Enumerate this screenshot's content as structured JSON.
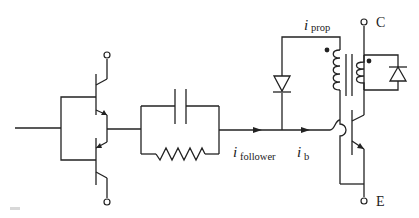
{
  "diagram": {
    "type": "circuit-schematic",
    "labels": {
      "i_follower": {
        "symbol": "i",
        "subscript": "follower"
      },
      "i_b": {
        "symbol": "i",
        "subscript": "b"
      },
      "i_prop": {
        "symbol": "i",
        "subscript": "prop"
      },
      "collector": "C",
      "emitter": "E"
    },
    "components": [
      {
        "id": "Q1",
        "kind": "npn-transistor",
        "role": "upper follower"
      },
      {
        "id": "Q2",
        "kind": "pnp-transistor",
        "role": "lower follower"
      },
      {
        "id": "C1",
        "kind": "capacitor",
        "role": "speed-up capacitor"
      },
      {
        "id": "R1",
        "kind": "resistor",
        "role": "base resistor"
      },
      {
        "id": "D1",
        "kind": "diode",
        "role": "proportional drive diode"
      },
      {
        "id": "T1",
        "kind": "current-transformer",
        "role": "proportional base drive"
      },
      {
        "id": "D2",
        "kind": "diode",
        "role": "transformer reset/clamp diode"
      },
      {
        "id": "Q3",
        "kind": "npn-transistor",
        "role": "power switch"
      }
    ],
    "colors": {
      "line": "#222222",
      "background": "#ffffff"
    }
  }
}
